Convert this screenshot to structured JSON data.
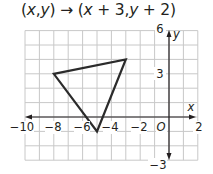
{
  "header": {
    "rule_parts": [
      "(",
      "x",
      ",",
      "y",
      ") → (",
      "x",
      " + 3,",
      "y",
      " + 2)"
    ],
    "rule_text": "(x,y) → (x + 3,y + 2)"
  },
  "axes": {
    "x_label": "x",
    "y_label": "y",
    "origin_label": "O",
    "x_ticks": [
      "−10",
      "−8",
      "−6",
      "−4",
      "−2",
      "2"
    ],
    "y_ticks": [
      "6",
      "3",
      "−3"
    ]
  },
  "figure": {
    "vertices": [
      [
        -8,
        3
      ],
      [
        -3,
        4
      ],
      [
        -5,
        -1
      ]
    ],
    "stroke_color": "#2b2b2b",
    "grid_color": "#c8c8c8",
    "axis_color": "#231f20"
  },
  "chart_data": {
    "type": "scatter",
    "title": "(x,y) → (x + 3,y + 2)",
    "xlabel": "x",
    "ylabel": "y",
    "xlim": [
      -10,
      2
    ],
    "ylim": [
      -3,
      6
    ],
    "grid": true,
    "x_tick_labels": [
      -10,
      -8,
      -6,
      -4,
      -2,
      2
    ],
    "y_tick_labels": [
      6,
      3,
      -3
    ],
    "series": [
      {
        "name": "triangle",
        "shape": "polygon",
        "points": [
          [
            -8,
            3
          ],
          [
            -3,
            4
          ],
          [
            -5,
            -1
          ]
        ]
      }
    ]
  }
}
